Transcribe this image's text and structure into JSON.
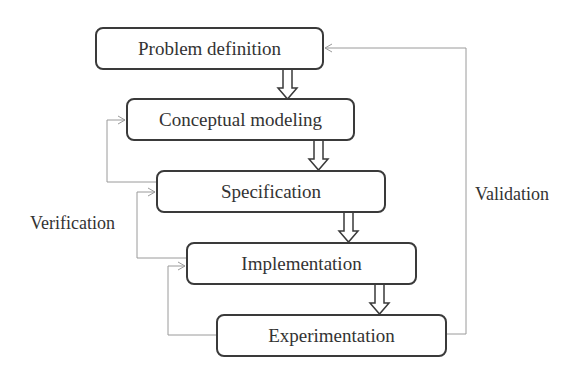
{
  "diagram": {
    "type": "flowchart",
    "steps": [
      {
        "id": "problem-definition",
        "label": "Problem definition",
        "x": 95,
        "y": 27,
        "w": 229,
        "h": 43
      },
      {
        "id": "conceptual-modeling",
        "label": "Conceptual modeling",
        "x": 126,
        "y": 98,
        "w": 229,
        "h": 43
      },
      {
        "id": "specification",
        "label": "Specification",
        "x": 156,
        "y": 170,
        "w": 230,
        "h": 43
      },
      {
        "id": "implementation",
        "label": "Implementation",
        "x": 186,
        "y": 242,
        "w": 231,
        "h": 43
      },
      {
        "id": "experimentation",
        "label": "Experimentation",
        "x": 216,
        "y": 314,
        "w": 231,
        "h": 43
      }
    ],
    "flow_arrows": [
      {
        "from": "problem-definition",
        "to": "conceptual-modeling"
      },
      {
        "from": "conceptual-modeling",
        "to": "specification"
      },
      {
        "from": "specification",
        "to": "implementation"
      },
      {
        "from": "implementation",
        "to": "experimentation"
      }
    ],
    "feedback_loops": [
      {
        "from": "specification",
        "to": "conceptual-modeling"
      },
      {
        "from": "implementation",
        "to": "specification"
      },
      {
        "from": "experimentation",
        "to": "implementation"
      },
      {
        "from": "experimentation",
        "to": "problem-definition"
      }
    ],
    "labels": {
      "verification": "Verification",
      "validation": "Validation"
    },
    "colors": {
      "box_border": "#3a3a3a",
      "feedback_line": "#9a9a9a",
      "text": "#333333"
    }
  }
}
